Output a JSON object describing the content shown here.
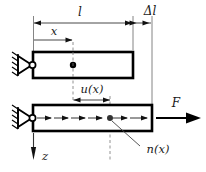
{
  "figure": {
    "background_color": "#ffffff",
    "line_color": "#000000",
    "thin_line_color": "#555555"
  },
  "labels": {
    "length": "l",
    "delta_length": "Δl",
    "coordinate_x": "x",
    "displacement": "u(x)",
    "distributed_load": "n(x)",
    "force": "F",
    "axis_z": "z"
  },
  "dimensions": {
    "length_line": {
      "label": "l",
      "x_start": 33,
      "x_end": 133,
      "y": 23
    },
    "delta_length_line": {
      "label": "Δl",
      "x_start": 133,
      "x_end": 152,
      "y": 23
    },
    "x_line": {
      "label": "x",
      "x_start": 33,
      "x_end": 73,
      "y": 40
    },
    "u_line": {
      "label": "u(x)",
      "x_start": 73,
      "x_end": 110,
      "y": 100
    }
  },
  "bars": {
    "upper": {
      "x": 33,
      "y": 52,
      "width": 100,
      "height": 26,
      "marker_x": 73
    },
    "lower": {
      "x": 33,
      "y": 105,
      "width": 119,
      "height": 26,
      "marker_x": 110
    }
  },
  "supports": {
    "upper_pin": {
      "x": 33,
      "y": 65
    },
    "lower_pin": {
      "x": 33,
      "y": 118
    }
  },
  "load_arrows": {
    "count": 7,
    "direction": "right",
    "y": 118
  },
  "force_arrow": {
    "label": "F",
    "x_start": 156,
    "x_end": 200,
    "y": 118
  },
  "z_axis": {
    "label": "z",
    "x": 33,
    "y_start": 133,
    "y_end": 160
  }
}
